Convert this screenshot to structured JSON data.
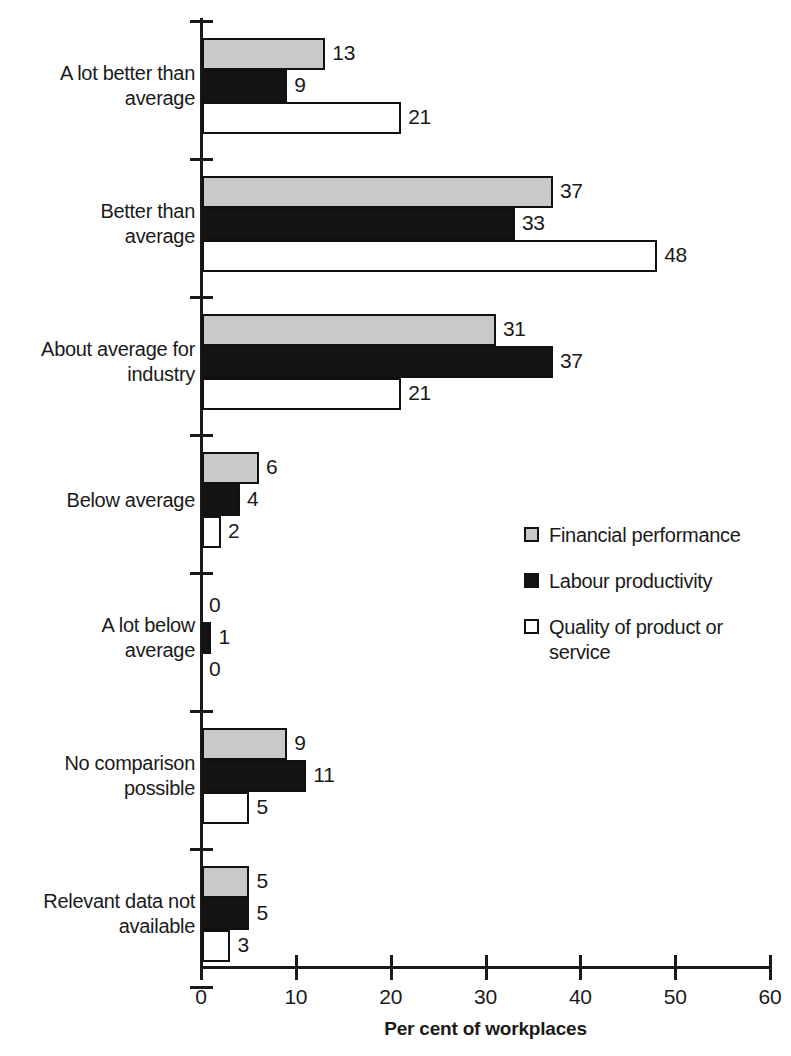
{
  "chart_data": {
    "type": "bar",
    "orientation": "horizontal",
    "title": "",
    "xlabel": "Per cent of workplaces",
    "ylabel": "",
    "xlim": [
      0,
      60
    ],
    "xticks": [
      0,
      10,
      20,
      30,
      40,
      50,
      60
    ],
    "xtick_labels": [
      "0",
      "10",
      "20",
      "30",
      "40",
      "50",
      "60"
    ],
    "grid": false,
    "legend_position": "center-right",
    "categories": [
      "A lot better than average",
      "Better than average",
      "About average for industry",
      "Below average",
      "A lot below average",
      "No comparison possible",
      "Relevant data not available"
    ],
    "series": [
      {
        "name": "Financial performance",
        "swatch": "s0",
        "color": "#c9c9c9",
        "values": [
          13,
          37,
          31,
          6,
          0,
          9,
          5
        ]
      },
      {
        "name": "Labour productivity",
        "swatch": "s1",
        "color": "#141414",
        "values": [
          9,
          33,
          37,
          4,
          1,
          11,
          5
        ]
      },
      {
        "name": "Quality of product or service",
        "swatch": "s2",
        "color": "#ffffff",
        "values": [
          21,
          48,
          21,
          2,
          0,
          5,
          3
        ]
      }
    ]
  },
  "category_lines": [
    [
      "A lot better than",
      "average"
    ],
    [
      "Better than",
      "average"
    ],
    [
      "About average for",
      "industry"
    ],
    [
      "Below average"
    ],
    [
      "A lot below",
      "average"
    ],
    [
      "No comparison",
      "possible"
    ],
    [
      "Relevant data not",
      "available"
    ]
  ],
  "legend": {
    "items": [
      {
        "swatch": "s0",
        "lines": [
          "Financial performance"
        ]
      },
      {
        "swatch": "s1",
        "lines": [
          "Labour productivity"
        ]
      },
      {
        "swatch": "s2",
        "lines": [
          "Quality of product or",
          "service"
        ]
      }
    ]
  },
  "axis": {
    "x_title": "Per cent of workplaces",
    "x_tick_labels": [
      "0",
      "10",
      "20",
      "30",
      "40",
      "50",
      "60"
    ]
  }
}
